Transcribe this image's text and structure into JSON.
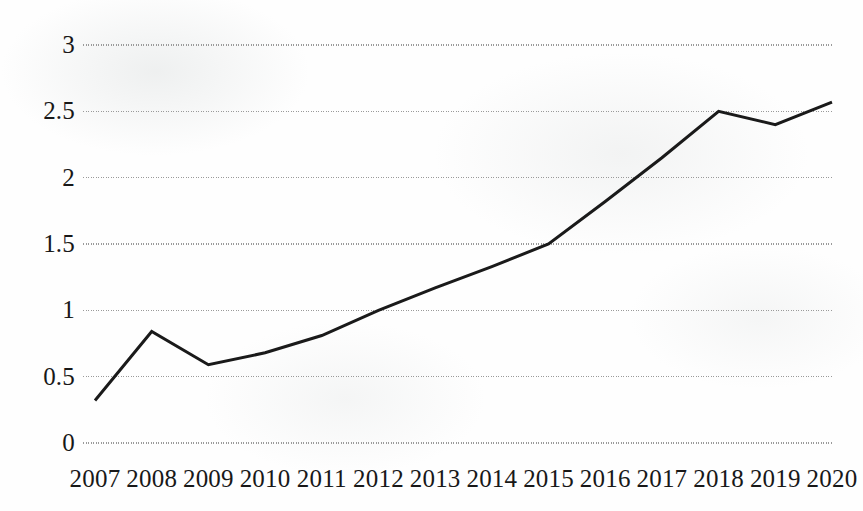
{
  "chart_data": {
    "type": "line",
    "title": "",
    "subtitle": "",
    "xlabel": "",
    "ylabel": "",
    "categories": [
      "2007",
      "2008",
      "2009",
      "2010",
      "2011",
      "2012",
      "2013",
      "2014",
      "2015",
      "2016",
      "2017",
      "2018",
      "2019",
      "2020"
    ],
    "values": [
      0.32,
      0.84,
      0.59,
      0.68,
      0.81,
      1.0,
      1.17,
      1.33,
      1.5,
      1.82,
      2.15,
      2.5,
      2.4,
      2.57
    ],
    "series": [
      {
        "name": "",
        "values": [
          0.32,
          0.84,
          0.59,
          0.68,
          0.81,
          1.0,
          1.17,
          1.33,
          1.5,
          1.82,
          2.15,
          2.5,
          2.4,
          2.57
        ]
      }
    ],
    "ylim": [
      0,
      3
    ],
    "yticks": [
      "0",
      "0.5",
      "1",
      "1.5",
      "2",
      "2.5",
      "3"
    ],
    "ytick_values": [
      0,
      0.5,
      1,
      1.5,
      2,
      2.5,
      3
    ],
    "xticks": [
      "2007",
      "2008",
      "2009",
      "2010",
      "2011",
      "2012",
      "2013",
      "2014",
      "2015",
      "2016",
      "2017",
      "2018",
      "2019",
      "2020"
    ],
    "grid": true,
    "grid_axis": "y",
    "grid_style": "dotted",
    "legend": false,
    "legend_position": "none",
    "markers": false,
    "annotations": []
  },
  "style": {
    "line_color": "#1a1a1a",
    "grid_color": "#9a9a9a",
    "background_color": "#fefefe",
    "text_color": "#181818",
    "line_width": "3"
  },
  "layout": {
    "plot_left": 95,
    "plot_right": 832,
    "plot_top": 45,
    "plot_bottom": 443
  }
}
